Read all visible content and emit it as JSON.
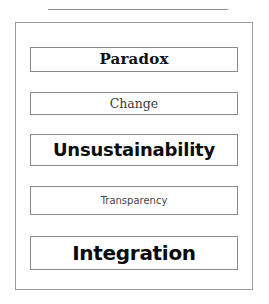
{
  "figure": {
    "background_color": "#ffffff",
    "rule_color": "#8e8e8e",
    "frame_color": "#9a9a9a",
    "box_border_color": "#8a8a8a"
  },
  "concepts": [
    {
      "label": "Paradox",
      "emphasis": "bold",
      "text_color": "#111111"
    },
    {
      "label": "Change",
      "emphasis": "regular",
      "text_color": "#3a3a3a"
    },
    {
      "label": "Unsustainability",
      "emphasis": "bold",
      "text_color": "#0d0d0d"
    },
    {
      "label": "Transparency",
      "emphasis": "regular",
      "text_color": "#444444"
    },
    {
      "label": "Integration",
      "emphasis": "bold",
      "text_color": "#0a0a0a"
    }
  ]
}
